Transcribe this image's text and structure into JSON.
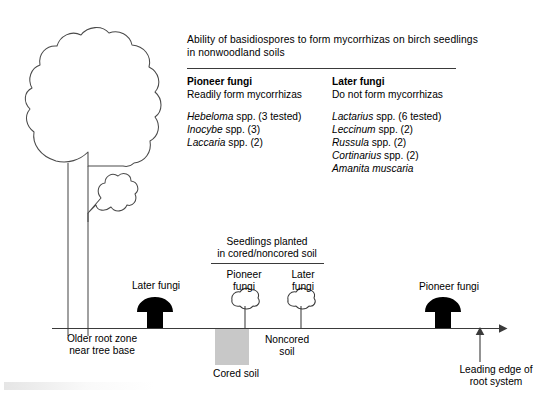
{
  "panel": {
    "title_line1": "Ability of basidiospores to form mycorrhizas on birch seedlings",
    "title_line2": "in nonwoodland soils",
    "columns": [
      {
        "heading": "Pioneer fungi",
        "subheading": "Readily form mycorrhizas"
      },
      {
        "heading": "Later fungi",
        "subheading": "Do not form mycorrhizas"
      }
    ],
    "pioneer_species": [
      {
        "genus": "Hebeloma",
        "rest": "spp. (3 tested)"
      },
      {
        "genus": "Inocybe",
        "rest": "spp. (3)"
      },
      {
        "genus": "Laccaria",
        "rest": "spp. (2)"
      }
    ],
    "later_species": [
      {
        "genus": "Lactarius",
        "rest": "spp. (6 tested)"
      },
      {
        "genus": "Leccinum",
        "rest": "spp. (2)"
      },
      {
        "genus": "Russula",
        "rest": "spp. (2)"
      },
      {
        "genus": "Cortinarius",
        "rest": "spp. (2)"
      },
      {
        "genus": "Amanita muscaria",
        "rest": ""
      }
    ]
  },
  "diagram": {
    "seedlings_label_line1": "Seedlings planted",
    "seedlings_label_line2": "in cored/noncored soil",
    "later_fungi_left": "Later fungi",
    "pioneer_fungi_seedling_line1": "Pioneer",
    "pioneer_fungi_seedling_line2": "fungi",
    "later_fungi_seedling_line1": "Later",
    "later_fungi_seedling_line2": "fungi",
    "pioneer_fungi_right": "Pioneer fungi",
    "older_root_line1": "Older root zone",
    "older_root_line2": "near tree base",
    "cored_soil": "Cored soil",
    "noncored_soil_line1": "Noncored",
    "noncored_soil_line2": "soil",
    "leading_edge_line1": "Leading edge of",
    "leading_edge_line2": "root system"
  },
  "colors": {
    "ink": "#111111",
    "line": "#3a3a3a",
    "mushroom_fill": "#000000",
    "cored_soil_fill": "#c8c8c8",
    "tree_outline": "#4a4a4a"
  }
}
